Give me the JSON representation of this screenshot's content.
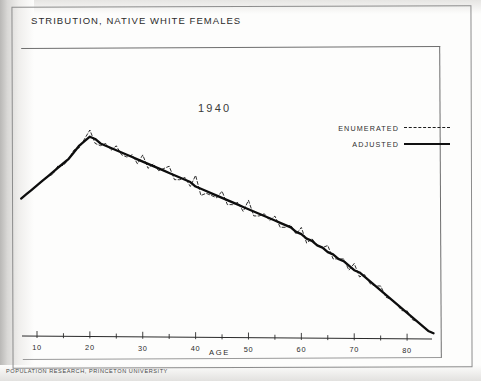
{
  "document": {
    "title": "STRIBUTION, NATIVE WHITE FEMALES",
    "footer": "POPULATION RESEARCH, PRINCETON UNIVERSITY",
    "year_label": "1940"
  },
  "legend": {
    "items": [
      {
        "label": "ENUMERATED",
        "style": "dashed"
      },
      {
        "label": "ADJUSTED",
        "style": "solid"
      }
    ]
  },
  "chart_data": {
    "type": "line",
    "title": "STRIBUTION, NATIVE WHITE FEMALES",
    "annotations": [
      "1940"
    ],
    "xlabel": "AGE",
    "ylabel": "",
    "grid": false,
    "legend_position": "upper-right",
    "xlim": [
      7,
      85
    ],
    "ylim": [
      0,
      100
    ],
    "xticks_major": [
      10,
      20,
      30,
      40,
      50,
      60,
      70,
      80
    ],
    "xticks_minor": [
      15,
      25,
      35,
      45,
      55,
      65,
      75
    ],
    "xtick_labels": [
      "10",
      "20",
      "30",
      "40",
      "50",
      "60",
      "70",
      "80"
    ],
    "x": [
      7,
      8,
      9,
      10,
      11,
      12,
      13,
      14,
      15,
      16,
      17,
      18,
      19,
      20,
      21,
      22,
      23,
      24,
      25,
      26,
      27,
      28,
      29,
      30,
      31,
      32,
      33,
      34,
      35,
      36,
      37,
      38,
      39,
      40,
      41,
      42,
      43,
      44,
      45,
      46,
      47,
      48,
      49,
      50,
      51,
      52,
      53,
      54,
      55,
      56,
      57,
      58,
      59,
      60,
      61,
      62,
      63,
      64,
      65,
      66,
      67,
      68,
      69,
      70,
      71,
      72,
      73,
      74,
      75,
      76,
      77,
      78,
      79,
      80,
      81,
      82,
      83,
      84,
      85
    ],
    "series": [
      {
        "name": "ADJUSTED",
        "style": "solid",
        "values": [
          62,
          64,
          66,
          68,
          70,
          72,
          74,
          76,
          78,
          80,
          83,
          86,
          88,
          90,
          89,
          87,
          86,
          85,
          84,
          83,
          82,
          81,
          80,
          79,
          78,
          77,
          76,
          75,
          74,
          73,
          72,
          71,
          70,
          68,
          67,
          66,
          65,
          64,
          63,
          62,
          61,
          60,
          59,
          58,
          57,
          56,
          55,
          54,
          53,
          52,
          51,
          50,
          48,
          47,
          45,
          44,
          42,
          41,
          39,
          38,
          36,
          35,
          33,
          31,
          30,
          28,
          26,
          24,
          22,
          20,
          18,
          16,
          14,
          12,
          10,
          8,
          6,
          4,
          3
        ]
      },
      {
        "name": "ENUMERATED",
        "style": "dashed",
        "values": [
          62,
          64,
          66,
          68,
          70,
          72,
          73,
          77,
          77,
          80,
          84,
          85,
          89,
          93,
          87,
          86,
          87,
          84,
          86,
          82,
          81,
          82,
          78,
          82,
          76,
          78,
          75,
          76,
          77,
          71,
          71,
          72,
          68,
          73,
          64,
          65,
          64,
          63,
          66,
          60,
          60,
          61,
          57,
          62,
          55,
          55,
          56,
          53,
          55,
          50,
          50,
          51,
          47,
          50,
          43,
          45,
          42,
          41,
          42,
          36,
          36,
          36,
          31,
          34,
          28,
          29,
          25,
          24,
          24,
          19,
          18,
          16,
          13,
          13,
          9,
          8,
          6,
          4,
          3
        ]
      }
    ]
  }
}
